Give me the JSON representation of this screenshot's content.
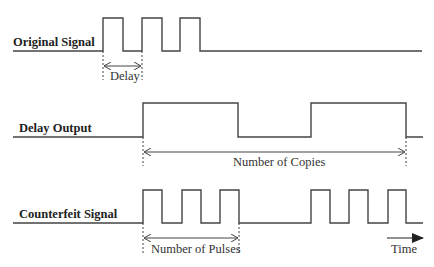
{
  "diagram": {
    "type": "timing-diagram",
    "signals": [
      {
        "name": "Original Signal",
        "high_y": 18,
        "low_y": 51,
        "edges": [
          [
            103,
            123
          ],
          [
            142,
            162
          ],
          [
            180,
            200
          ]
        ],
        "x_start": 13,
        "x_end": 422
      },
      {
        "name": "Delay Output",
        "high_y": 103,
        "low_y": 137,
        "edges": [
          [
            143,
            238
          ],
          [
            311,
            406
          ]
        ],
        "x_start": 13,
        "x_end": 423
      },
      {
        "name": "Counterfeit Signal",
        "high_y": 190,
        "low_y": 223,
        "edges": [
          [
            143,
            162
          ],
          [
            182,
            201
          ],
          [
            220,
            239
          ],
          [
            311,
            330
          ],
          [
            349,
            368
          ],
          [
            388,
            406
          ]
        ],
        "x_start": 13,
        "x_end": 423
      }
    ],
    "annotations": {
      "delay": "Delay",
      "copies": "Number of Copies",
      "pulses": "Number of Pulses",
      "time": "Time"
    },
    "colors": {
      "line": "#444444",
      "text": "#222222",
      "background": "#ffffff"
    }
  }
}
